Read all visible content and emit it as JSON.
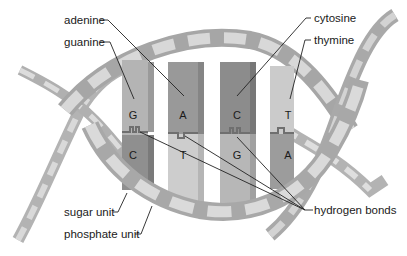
{
  "diagram": {
    "labels": {
      "adenine": "adenine",
      "guanine": "guanine",
      "cytosine": "cytosine",
      "thymine": "thymine",
      "sugar_unit": "sugar unit",
      "phosphate_unit": "phosphate unit",
      "hydrogen_bonds": "hydrogen bonds"
    },
    "base_pairs": [
      {
        "top": "G",
        "bottom": "C"
      },
      {
        "top": "A",
        "bottom": "T"
      },
      {
        "top": "C",
        "bottom": "G"
      },
      {
        "top": "T",
        "bottom": "A"
      }
    ],
    "colors": {
      "backbone_dark": "#a8a8a8",
      "backbone_light": "#d6d6d6",
      "base_dark": "#8c8c8c",
      "base_mid": "#a9a9a9",
      "base_light": "#cfcfcf"
    }
  }
}
